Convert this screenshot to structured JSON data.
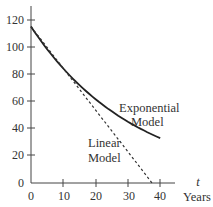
{
  "chart_data": {
    "type": "line",
    "title": "",
    "xlabel": "Years since 1980",
    "xlabel_var": "t",
    "ylabel": "",
    "xlim": [
      0,
      45
    ],
    "ylim": [
      0,
      130
    ],
    "grid": false,
    "x_ticks": [
      0,
      10,
      20,
      30,
      40
    ],
    "y_ticks": [
      0,
      20,
      40,
      60,
      80,
      100,
      120
    ],
    "series": [
      {
        "name": "Exponential Model",
        "style": "solid",
        "x": [
          0,
          5,
          10,
          15,
          20,
          25,
          30,
          35,
          40
        ],
        "values": [
          115,
          98,
          84,
          72,
          61,
          53,
          45,
          39,
          33
        ]
      },
      {
        "name": "Linear Model",
        "style": "dashed",
        "x": [
          0,
          10,
          20,
          30,
          37.5
        ],
        "values": [
          115,
          84.3,
          53.6,
          23,
          0
        ]
      }
    ],
    "annotations": [
      {
        "text": "Exponential",
        "near": "exponential curve end"
      },
      {
        "text": "Model",
        "near": "exponential curve end"
      },
      {
        "text": "Linear",
        "near": "dashed line"
      },
      {
        "text": "Model",
        "near": "dashed line"
      }
    ]
  },
  "labels": {
    "exp_line1": "Exponential",
    "exp_line2": "Model",
    "lin_line1": "Linear",
    "lin_line2": "Model",
    "axis_var": "t",
    "axis_line1": "Years",
    "axis_line2": "since",
    "axis_line3": "1980"
  },
  "ticks": {
    "x": [
      "0",
      "10",
      "20",
      "30",
      "40"
    ],
    "y": [
      "0",
      "20",
      "40",
      "60",
      "80",
      "100",
      "120"
    ]
  }
}
